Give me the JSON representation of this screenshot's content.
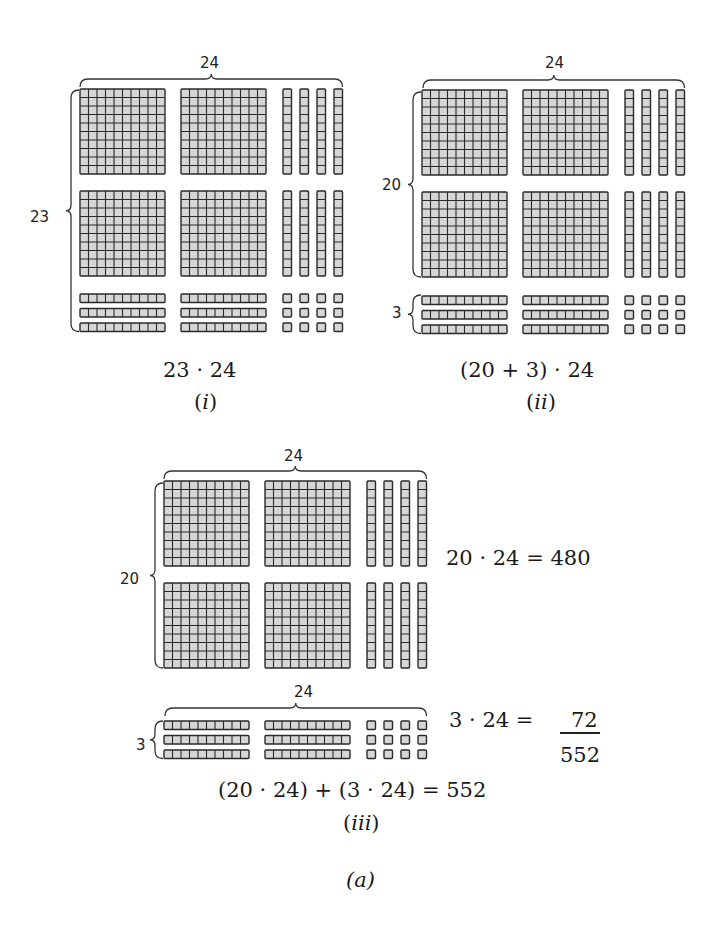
{
  "figure": {
    "caption": "(a)",
    "colors": {
      "block_fill": "#d6d6d6",
      "block_line": "#2a2a2a",
      "text": "#1a1a1a"
    }
  },
  "panels": [
    {
      "id": "i",
      "caption": "(i)",
      "caption_roman": "i",
      "expression": "23 · 24",
      "top_brace_label": "24",
      "side_labels": [
        {
          "label": "23",
          "spans": "all-rows"
        }
      ],
      "rows": {
        "hundreds": 2,
        "tens_strips": 3
      },
      "cols": {
        "hundreds": 2,
        "tens_rods": 4
      }
    },
    {
      "id": "ii",
      "caption": "(ii)",
      "caption_roman": "ii",
      "expression": "(20 + 3) · 24",
      "top_brace_label": "24",
      "side_labels": [
        {
          "label": "20",
          "spans": "hundreds-rows"
        },
        {
          "label": "3",
          "spans": "tens-strips"
        }
      ],
      "rows": {
        "hundreds": 2,
        "tens_strips": 3
      },
      "cols": {
        "hundreds": 2,
        "tens_rods": 4
      }
    },
    {
      "id": "iii",
      "caption": "(iii)",
      "caption_roman": "iii",
      "top_part": {
        "top_brace_label": "24",
        "side_label": "20",
        "equation": "20 · 24 = 480"
      },
      "bottom_part": {
        "top_brace_label": "24",
        "side_label": "3",
        "equation": "3 · 24 = ",
        "addend": "72",
        "sum": "552"
      },
      "expression": "(20 · 24) + (3 · 24) = 552"
    }
  ]
}
